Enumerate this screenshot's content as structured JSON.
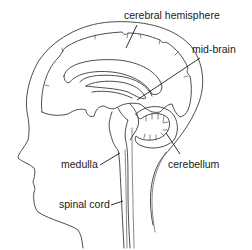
{
  "diagram": {
    "labels": {
      "cerebral_hemisphere": "cerebral hemisphere",
      "mid_brain": "mid-brain",
      "medulla": "medulla",
      "cerebellum": "cerebellum",
      "spinal_cord": "spinal cord"
    },
    "colors": {
      "line": "#3a3a3a",
      "text": "#1a1a1a",
      "background": "#ffffff"
    }
  }
}
